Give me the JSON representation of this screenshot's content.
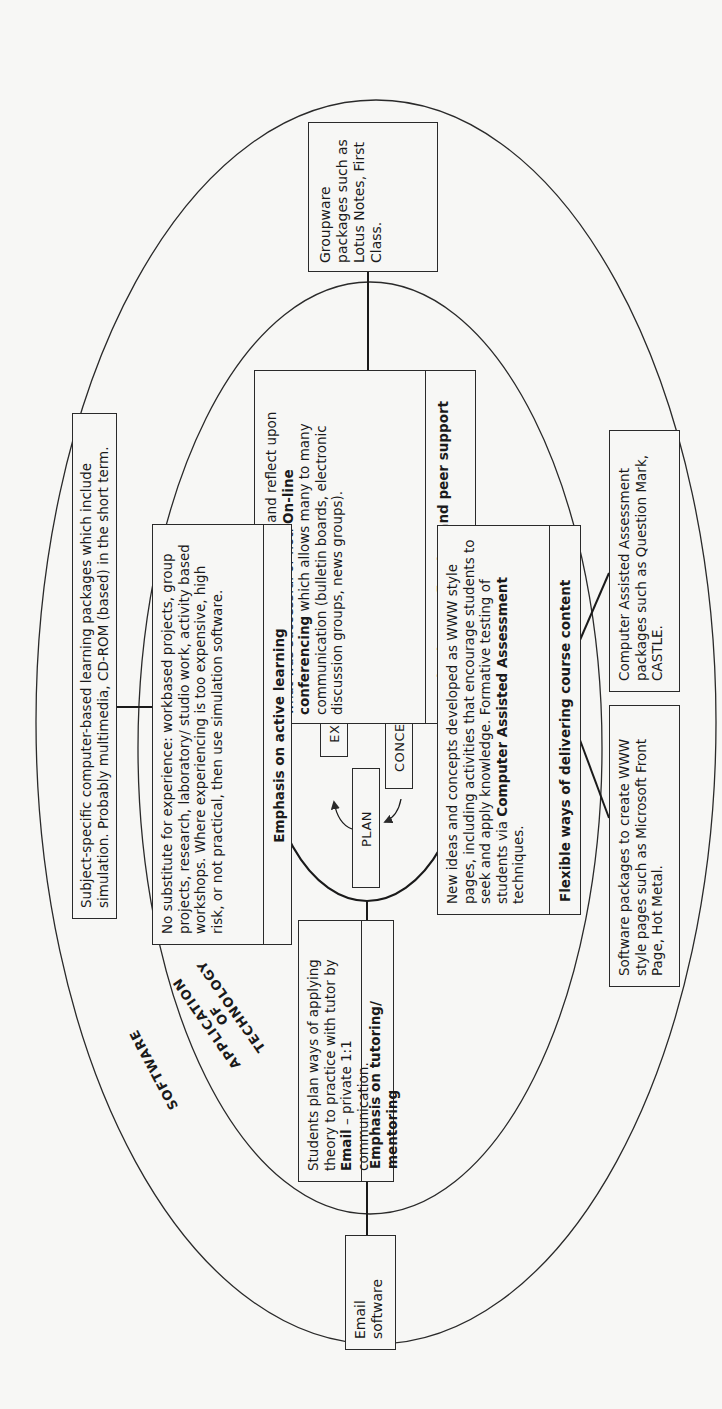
{
  "diagram": {
    "layers": {
      "outer_label": "SOFTWARE",
      "inner_label_lines": [
        "APPLICATION",
        "OF",
        "TECHNOLOGY"
      ]
    },
    "cycle": {
      "stages": [
        "EXPERIENCE",
        "REFLECTION",
        "CONCEPTUALIZE",
        "PLAN"
      ]
    },
    "application_boxes": {
      "reflection": {
        "text_parts": [
          {
            "t": "Students share experiences and reflect upon what was successful or not. ",
            "bold": false
          },
          {
            "t": "On-line conferencing",
            "bold": true
          },
          {
            "t": " which allows many to many communication (bulletin boards, electronic discussion groups, news groups).",
            "bold": false
          }
        ],
        "emphasis": "Emphasis on reflection and peer support"
      },
      "active_learning": {
        "text": "No substitute for experience: workbased projects, group projects, research, laboratory/ studio work, activity based workshops. Where experiencing is too expensive, high risk, or not practical, then use simulation software.",
        "emphasis": "Emphasis on active learning"
      },
      "course_content": {
        "text_parts": [
          {
            "t": "New ideas and concepts developed as WWW style pages, including activities that encourage students to seek and apply knowledge. Formative testing of students via ",
            "bold": false
          },
          {
            "t": "Computer Assisted Assessment",
            "bold": true
          },
          {
            "t": " techniques.",
            "bold": false
          }
        ],
        "emphasis": "Flexible ways of delivering course content"
      },
      "tutoring": {
        "text_parts": [
          {
            "t": "Students plan ways of applying theory to practice with tutor by ",
            "bold": false
          },
          {
            "t": "Email",
            "bold": true
          },
          {
            "t": " – private 1:1 communication.",
            "bold": false
          }
        ],
        "emphasis": "Emphasis on tutoring/ mentoring"
      }
    },
    "software_boxes": {
      "groupware": "Groupware packages such as Lotus Notes, First Class.",
      "subject_specific": "Subject-specific computer-based learning packages which include simulation. Probably multimedia, CD-ROM (based) in the short term.",
      "caa_packages": "Computer Assisted Assessment packages such as Question Mark, CASTLE.",
      "www_packages": "Software packages to create WWW style pages such as Microsoft Front Page, Hot Metal.",
      "email": "Email software"
    },
    "colors": {
      "background": "#f7f7f5",
      "stroke": "#2a2a2a",
      "text": "#1a1a1a"
    }
  }
}
